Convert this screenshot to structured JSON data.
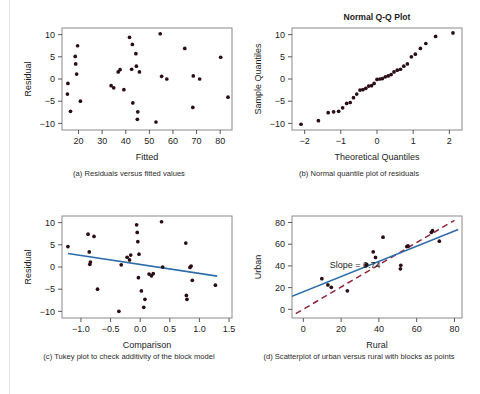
{
  "figure": {
    "name": "regression-diagnostics-figure",
    "panel_count": 4
  },
  "captions": {
    "a": "(a) Residuals versus fitted values",
    "b": "(b) Normal quantile plot of residuals",
    "c": "(c) Tukey plot to check additivity of the block model",
    "d": "(d) Scatterplot of urban versus rural with blocks as points"
  },
  "colors": {
    "marker": "#2a0d16",
    "fit_line": "#2e6da8",
    "reference_line": "#8c2538",
    "frame": "#8a8a8f",
    "background": "#ffffff",
    "text": "#1c1c1c"
  },
  "chart_data": [
    {
      "id": "panel-a",
      "type": "scatter",
      "title": "",
      "xlabel": "Fitted",
      "ylabel": "Residual",
      "xlim": [
        13,
        85
      ],
      "ylim": [
        -11.5,
        11.5
      ],
      "xticks": [
        20,
        30,
        40,
        50,
        60,
        70,
        80
      ],
      "yticks": [
        -10,
        -5,
        0,
        5,
        10
      ],
      "grid": false,
      "legend": "none",
      "points": [
        [
          15.5,
          -1.0
        ],
        [
          15.3,
          -3.4
        ],
        [
          16.6,
          -7.3
        ],
        [
          18.6,
          5.1
        ],
        [
          18.8,
          3.4
        ],
        [
          19.2,
          1.1
        ],
        [
          19.6,
          7.5
        ],
        [
          20.8,
          -5.0
        ],
        [
          33.8,
          -1.5
        ],
        [
          34.9,
          -2.0
        ],
        [
          36.8,
          1.6
        ],
        [
          37.6,
          2.1
        ],
        [
          39.2,
          -2.4
        ],
        [
          41.6,
          9.4
        ],
        [
          42.5,
          2.2
        ],
        [
          42.8,
          7.8
        ],
        [
          43.0,
          -5.4
        ],
        [
          44.3,
          5.7
        ],
        [
          44.5,
          2.9
        ],
        [
          45.1,
          -7.4
        ],
        [
          44.9,
          -9.1
        ],
        [
          45.8,
          1.6
        ],
        [
          52.8,
          -9.7
        ],
        [
          54.6,
          10.2
        ],
        [
          55.2,
          0.6
        ],
        [
          57.4,
          0.0
        ],
        [
          65.0,
          6.9
        ],
        [
          68.6,
          0.7
        ],
        [
          68.4,
          -6.4
        ],
        [
          71.3,
          0.0
        ],
        [
          80.2,
          4.9
        ],
        [
          83.3,
          -4.1
        ]
      ]
    },
    {
      "id": "panel-b",
      "type": "scatter",
      "title": "Normal Q-Q Plot",
      "xlabel": "Theoretical Quantiles",
      "ylabel": "Sample Quantiles",
      "xlim": [
        -2.35,
        2.35
      ],
      "ylim": [
        -11.5,
        11.5
      ],
      "xticks": [
        -2,
        -1,
        0,
        1,
        2
      ],
      "yticks": [
        -10,
        -5,
        0,
        5,
        10
      ],
      "grid": false,
      "legend": "none",
      "points": [
        [
          -2.1,
          -10.2
        ],
        [
          -1.62,
          -9.4
        ],
        [
          -1.35,
          -7.6
        ],
        [
          -1.2,
          -7.4
        ],
        [
          -1.06,
          -7.3
        ],
        [
          -0.95,
          -6.5
        ],
        [
          -0.84,
          -5.5
        ],
        [
          -0.74,
          -5.3
        ],
        [
          -0.65,
          -4.2
        ],
        [
          -0.56,
          -3.4
        ],
        [
          -0.47,
          -2.5
        ],
        [
          -0.39,
          -2.4
        ],
        [
          -0.31,
          -2.1
        ],
        [
          -0.23,
          -1.6
        ],
        [
          -0.15,
          -1.5
        ],
        [
          -0.08,
          -1.0
        ],
        [
          0.0,
          -0.1
        ],
        [
          0.08,
          0.0
        ],
        [
          0.15,
          0.1
        ],
        [
          0.23,
          0.5
        ],
        [
          0.31,
          0.7
        ],
        [
          0.39,
          1.0
        ],
        [
          0.47,
          1.6
        ],
        [
          0.56,
          2.0
        ],
        [
          0.65,
          2.2
        ],
        [
          0.74,
          2.9
        ],
        [
          0.84,
          3.4
        ],
        [
          0.95,
          5.0
        ],
        [
          1.06,
          5.6
        ],
        [
          1.2,
          6.9
        ],
        [
          1.35,
          8.0
        ],
        [
          1.62,
          9.6
        ],
        [
          2.1,
          10.4
        ]
      ]
    },
    {
      "id": "panel-c",
      "type": "scatter",
      "title": "",
      "xlabel": "Comparison",
      "ylabel": "Residual",
      "xlim": [
        -1.32,
        1.55
      ],
      "ylim": [
        -11.5,
        11.5
      ],
      "xticks": [
        -1.0,
        -0.5,
        0.0,
        0.5,
        1.0,
        1.5
      ],
      "xtick_labels": [
        "-1.0",
        "-0.5",
        "0.0",
        "0.5",
        "1.0",
        "1.5"
      ],
      "yticks": [
        -10,
        -5,
        0,
        5,
        10
      ],
      "grid": false,
      "legend": "none",
      "fit_line": {
        "x0": -1.22,
        "y0": 3.05,
        "x1": 1.3,
        "y1": -2.05,
        "style": "solid",
        "color": "#2e6da8"
      },
      "points": [
        [
          -1.22,
          4.6
        ],
        [
          -0.88,
          7.4
        ],
        [
          -0.86,
          3.4
        ],
        [
          -0.84,
          1.1
        ],
        [
          -0.85,
          0.6
        ],
        [
          -0.78,
          6.9
        ],
        [
          -0.72,
          -5.0
        ],
        [
          -0.36,
          -10.0
        ],
        [
          -0.32,
          0.5
        ],
        [
          -0.22,
          2.2
        ],
        [
          -0.18,
          1.6
        ],
        [
          -0.16,
          2.7
        ],
        [
          -0.06,
          9.5
        ],
        [
          -0.05,
          7.8
        ],
        [
          -0.04,
          5.7
        ],
        [
          -0.03,
          -2.4
        ],
        [
          -0.02,
          2.9
        ],
        [
          0.02,
          -5.4
        ],
        [
          0.06,
          -9.1
        ],
        [
          0.08,
          -7.3
        ],
        [
          0.15,
          -1.6
        ],
        [
          0.19,
          -2.0
        ],
        [
          0.22,
          -1.5
        ],
        [
          0.36,
          10.2
        ],
        [
          0.38,
          0.0
        ],
        [
          0.77,
          5.4
        ],
        [
          0.78,
          -6.4
        ],
        [
          0.79,
          -7.3
        ],
        [
          0.84,
          -0.1
        ],
        [
          0.86,
          0.2
        ],
        [
          0.88,
          -3.0
        ],
        [
          1.27,
          -4.1
        ]
      ]
    },
    {
      "id": "panel-d",
      "type": "scatter",
      "title": "",
      "xlabel": "Rural",
      "ylabel": "Urban",
      "xlim": [
        -6,
        84
      ],
      "ylim": [
        -8,
        86
      ],
      "xticks": [
        0,
        20,
        40,
        60,
        80
      ],
      "yticks": [
        0,
        20,
        40,
        60,
        80
      ],
      "grid": false,
      "legend": "none",
      "annotation": {
        "text": "Slope = 0.74",
        "x": 14,
        "y": 41
      },
      "fit_line": {
        "x0": -6,
        "y0": 12.0,
        "x1": 82,
        "y1": 73.5,
        "style": "solid",
        "color": "#2e6da8"
      },
      "reference_line": {
        "x0": -4,
        "y0": -4.0,
        "x1": 80,
        "y1": 82.0,
        "style": "dashed",
        "color": "#8c2538"
      },
      "points": [
        [
          9.8,
          28.2
        ],
        [
          13.0,
          22.5
        ],
        [
          14.8,
          20.3
        ],
        [
          23.3,
          17.0
        ],
        [
          33.2,
          40.8
        ],
        [
          33.6,
          41.2
        ],
        [
          37.0,
          53.0
        ],
        [
          38.2,
          47.8
        ],
        [
          42.2,
          66.5
        ],
        [
          51.4,
          37.3
        ],
        [
          51.6,
          40.6
        ],
        [
          54.8,
          57.8
        ],
        [
          55.4,
          58.4
        ],
        [
          67.8,
          71.0
        ],
        [
          68.4,
          72.5
        ],
        [
          72.0,
          62.8
        ]
      ]
    }
  ]
}
